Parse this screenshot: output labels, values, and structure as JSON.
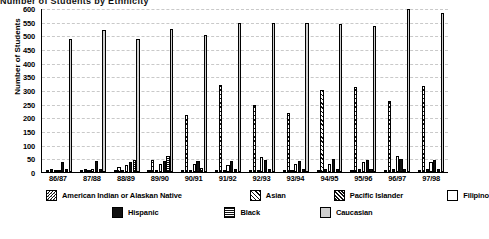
{
  "title_fragment": "Number of Students by Ethnicity",
  "axis": {
    "ylabel": "Number of Students",
    "yticks": [
      "600",
      "550",
      "500",
      "450",
      "400",
      "350",
      "300",
      "250",
      "200",
      "150",
      "100",
      "50",
      "0"
    ]
  },
  "legend": {
    "row1": [
      {
        "key": "american_indian",
        "label": "American Indian or Alaskan Native",
        "pattern": "p-amind"
      },
      {
        "key": "asian",
        "label": "Asian",
        "pattern": "p-asian"
      },
      {
        "key": "pacific_islander",
        "label": "Pacific Islander",
        "pattern": "p-pacific"
      },
      {
        "key": "filipino",
        "label": "Filipino",
        "pattern": "p-filipino"
      }
    ],
    "row2": [
      {
        "key": "hispanic",
        "label": "Hispanic",
        "pattern": "p-hispanic"
      },
      {
        "key": "black",
        "label": "Black",
        "pattern": "p-black"
      },
      {
        "key": "caucasian",
        "label": "Caucasian",
        "pattern": "p-caucasian"
      }
    ]
  },
  "chart_data": {
    "type": "bar",
    "title": "Number of Students by Ethnicity",
    "xlabel": "",
    "ylabel": "Number of Students",
    "ylim": [
      0,
      600
    ],
    "ytick_step": 50,
    "grid": true,
    "legend_position": "bottom",
    "categories": [
      "86/87",
      "87/88",
      "88/89",
      "89/90",
      "90/91",
      "91/92",
      "92/93",
      "93/94",
      "94/95",
      "95/96",
      "96/97",
      "97/98"
    ],
    "series": [
      {
        "name": "American Indian or Alaskan Native",
        "pattern": "p-amind",
        "values": [
          8,
          6,
          6,
          5,
          6,
          5,
          6,
          5,
          6,
          6,
          6,
          6
        ]
      },
      {
        "name": "Asian",
        "pattern": "p-asian",
        "values": [
          10,
          12,
          20,
          45,
          210,
          320,
          245,
          215,
          300,
          310,
          260,
          315
        ]
      },
      {
        "name": "Pacific Islander",
        "pattern": "p-pacific",
        "values": [
          6,
          5,
          6,
          6,
          8,
          8,
          8,
          8,
          10,
          10,
          10,
          10
        ]
      },
      {
        "name": "Filipino",
        "pattern": "p-filipino",
        "values": [
          8,
          10,
          25,
          30,
          28,
          25,
          55,
          30,
          30,
          35,
          60,
          35
        ]
      },
      {
        "name": "Hispanic",
        "pattern": "p-hispanic",
        "values": [
          35,
          40,
          38,
          40,
          42,
          40,
          45,
          40,
          48,
          45,
          48,
          45
        ]
      },
      {
        "name": "Black",
        "pattern": "p-black",
        "values": [
          12,
          12,
          45,
          60,
          14,
          12,
          12,
          12,
          12,
          12,
          12,
          12
        ]
      },
      {
        "name": "Caucasian",
        "pattern": "p-caucasian",
        "values": [
          485,
          520,
          485,
          525,
          500,
          545,
          545,
          545,
          540,
          535,
          595,
          580
        ]
      }
    ]
  }
}
